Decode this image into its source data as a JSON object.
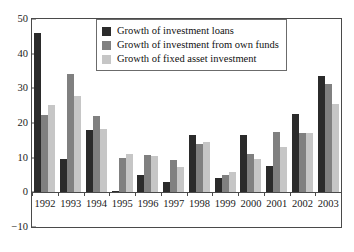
{
  "chart_data": {
    "type": "bar",
    "title": "",
    "xlabel": "",
    "ylabel": "",
    "ylim": [
      -10,
      50
    ],
    "yticks": [
      50,
      40,
      30,
      20,
      10,
      0,
      -10
    ],
    "grid": false,
    "legend_position": "top-center",
    "categories": [
      "1992",
      "1993",
      "1994",
      "1995",
      "1996",
      "1997",
      "1998",
      "1999",
      "2000",
      "2001",
      "2002",
      "2003"
    ],
    "series": [
      {
        "name": "Growth of investment loans",
        "color": "#2b2b2b",
        "values": [
          46,
          9.5,
          18,
          0.3,
          5,
          3.1,
          16.5,
          4.1,
          16.6,
          7.7,
          22.7,
          33.5
        ]
      },
      {
        "name": "Growth of investment from own funds",
        "color": "#808080",
        "values": [
          22.3,
          34,
          22,
          10,
          10.8,
          9.3,
          13.9,
          5,
          11.2,
          17.4,
          17.2,
          31.2
        ]
      },
      {
        "name": "Growth of fixed asset investment",
        "color": "#c6c6c6",
        "values": [
          25.2,
          27.8,
          18.2,
          11.1,
          10.4,
          7.4,
          14.5,
          5.9,
          9.5,
          13.1,
          17.2,
          25.6
        ]
      }
    ]
  }
}
